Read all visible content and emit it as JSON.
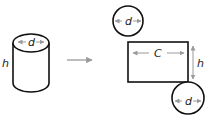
{
  "diagram": {
    "colors": {
      "stroke": "#111111",
      "dimension_arrow": "#9a9a9a",
      "transform_arrow": "#9a9a9a",
      "label": "#222222"
    },
    "cylinder": {
      "diameter_label": "d",
      "height_label": "h"
    },
    "transform_arrow": {
      "meaning": "unfold"
    },
    "net": {
      "top_circle": {
        "label": "d"
      },
      "rectangle": {
        "width_label": "C",
        "height_label": "h"
      },
      "bottom_circle": {
        "label": "d"
      }
    }
  }
}
